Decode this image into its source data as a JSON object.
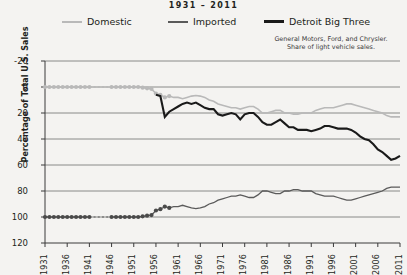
{
  "title": "1931 – 2011",
  "legend": {
    "position": "top",
    "items": [
      {
        "label": "Domestic",
        "color": "#b9b9b9",
        "name": "legend-domestic"
      },
      {
        "label": "Imported",
        "color": "#5a5a5a",
        "name": "legend-imported"
      },
      {
        "label": "Detroit Big Three",
        "color": "#1a1a1a",
        "name": "legend-detroit"
      }
    ]
  },
  "note": {
    "line1": "General Motors, Ford, and Chrysler.",
    "line2": "Share of light vehicle sales."
  },
  "axes": {
    "ylabel": "Percentage of Total U.S. Sales",
    "xlabel": "",
    "yticks": [
      "120",
      "100",
      "80",
      "60",
      "40",
      "20",
      "0",
      "-20"
    ],
    "xticks": [
      "1931",
      "1936",
      "1941",
      "1946",
      "1951",
      "1956",
      "1961",
      "1966",
      "1971",
      "1976",
      "1981",
      "1986",
      "1991",
      "1996",
      "2001",
      "2006",
      "2011"
    ]
  },
  "chart_data": {
    "type": "line",
    "title": "1931 – 2011",
    "xlabel": "",
    "ylabel": "Percentage of Total U.S. Sales",
    "xlim": [
      1931,
      2011
    ],
    "ylim": [
      -20,
      120
    ],
    "yticks": [
      -20,
      0,
      20,
      40,
      60,
      80,
      100,
      120
    ],
    "xticks": [
      1931,
      1936,
      1941,
      1946,
      1951,
      1956,
      1961,
      1966,
      1971,
      1976,
      1981,
      1986,
      1991,
      1996,
      2001,
      2006,
      2011
    ],
    "grid": "horizontal",
    "legend_position": "top",
    "annotations": [
      "General Motors, Ford, and Chrysler.",
      "Share of light vehicle sales."
    ],
    "series": [
      {
        "name": "Domestic",
        "color": "#b9b9b9",
        "style": "solid-with-markers-early",
        "x": [
          1931,
          1932,
          1933,
          1934,
          1935,
          1936,
          1937,
          1938,
          1939,
          1940,
          1941,
          1946,
          1947,
          1948,
          1949,
          1950,
          1951,
          1952,
          1953,
          1954,
          1955,
          1956,
          1957,
          1958,
          1959,
          1960,
          1961,
          1962,
          1963,
          1964,
          1965,
          1966,
          1967,
          1968,
          1969,
          1970,
          1971,
          1972,
          1973,
          1974,
          1975,
          1976,
          1977,
          1978,
          1979,
          1980,
          1981,
          1982,
          1983,
          1984,
          1985,
          1986,
          1987,
          1988,
          1989,
          1990,
          1991,
          1992,
          1993,
          1994,
          1995,
          1996,
          1997,
          1998,
          1999,
          2000,
          2001,
          2002,
          2003,
          2004,
          2005,
          2006,
          2007,
          2008,
          2009,
          2010,
          2011
        ],
        "y": [
          100,
          100,
          100,
          100,
          100,
          100,
          100,
          100,
          100,
          100,
          100,
          100,
          100,
          100,
          100,
          100,
          100,
          100,
          99.5,
          99,
          98.5,
          95,
          94,
          92,
          93,
          92,
          92,
          91,
          92,
          93,
          93.5,
          93,
          92,
          90,
          89,
          87,
          86,
          85,
          84,
          84,
          83,
          84,
          85,
          85,
          83,
          80,
          80,
          81,
          82,
          82,
          80,
          80,
          79,
          79,
          80,
          80,
          80,
          82,
          83,
          84,
          84,
          84,
          85,
          86,
          87,
          87,
          86,
          85,
          84,
          83,
          82,
          81,
          80,
          78,
          77,
          77,
          77
        ]
      },
      {
        "name": "Imported",
        "color": "#5a5a5a",
        "style": "solid-with-markers-early",
        "x": [
          1931,
          1932,
          1933,
          1934,
          1935,
          1936,
          1937,
          1938,
          1939,
          1940,
          1941,
          1946,
          1947,
          1948,
          1949,
          1950,
          1951,
          1952,
          1953,
          1954,
          1955,
          1956,
          1957,
          1958,
          1959,
          1960,
          1961,
          1962,
          1963,
          1964,
          1965,
          1966,
          1967,
          1968,
          1969,
          1970,
          1971,
          1972,
          1973,
          1974,
          1975,
          1976,
          1977,
          1978,
          1979,
          1980,
          1981,
          1982,
          1983,
          1984,
          1985,
          1986,
          1987,
          1988,
          1989,
          1990,
          1991,
          1992,
          1993,
          1994,
          1995,
          1996,
          1997,
          1998,
          1999,
          2000,
          2001,
          2002,
          2003,
          2004,
          2005,
          2006,
          2007,
          2008,
          2009,
          2010,
          2011
        ],
        "y": [
          0,
          0,
          0,
          0,
          0,
          0,
          0,
          0,
          0,
          0,
          0,
          0,
          0,
          0,
          0,
          0,
          0,
          0,
          0.5,
          1,
          1.5,
          5,
          6,
          8,
          7,
          8,
          8,
          9,
          8,
          7,
          6.5,
          7,
          8,
          10,
          11,
          13,
          14,
          15,
          16,
          16,
          17,
          16,
          15,
          15,
          17,
          20,
          20,
          19,
          18,
          18,
          20,
          20,
          21,
          21,
          20,
          20,
          20,
          18,
          17,
          16,
          16,
          16,
          15,
          14,
          13,
          13,
          14,
          15,
          16,
          17,
          18,
          19,
          20,
          22,
          23,
          23,
          23
        ]
      },
      {
        "name": "Detroit Big Three",
        "color": "#1a1a1a",
        "style": "solid",
        "x": [
          1956,
          1957,
          1958,
          1959,
          1960,
          1961,
          1962,
          1963,
          1964,
          1965,
          1966,
          1967,
          1968,
          1969,
          1970,
          1971,
          1972,
          1973,
          1974,
          1975,
          1976,
          1977,
          1978,
          1979,
          1980,
          1981,
          1982,
          1983,
          1984,
          1985,
          1986,
          1987,
          1988,
          1989,
          1990,
          1991,
          1992,
          1993,
          1994,
          1995,
          1996,
          1997,
          1998,
          1999,
          2000,
          2001,
          2002,
          2003,
          2004,
          2005,
          2006,
          2007,
          2008,
          2009,
          2010,
          2011
        ],
        "y": [
          94,
          93,
          77,
          81,
          83,
          85,
          87,
          88,
          87,
          88,
          86,
          84,
          83,
          83,
          79,
          78,
          79,
          80,
          79,
          75,
          79,
          80,
          80,
          77,
          73,
          71,
          71,
          73,
          75,
          72,
          69,
          69,
          67,
          67,
          67,
          66,
          67,
          68,
          70,
          70,
          69,
          68,
          68,
          68,
          67,
          65,
          62,
          60,
          59,
          56,
          52,
          50,
          47,
          44,
          45,
          47
        ]
      }
    ]
  }
}
